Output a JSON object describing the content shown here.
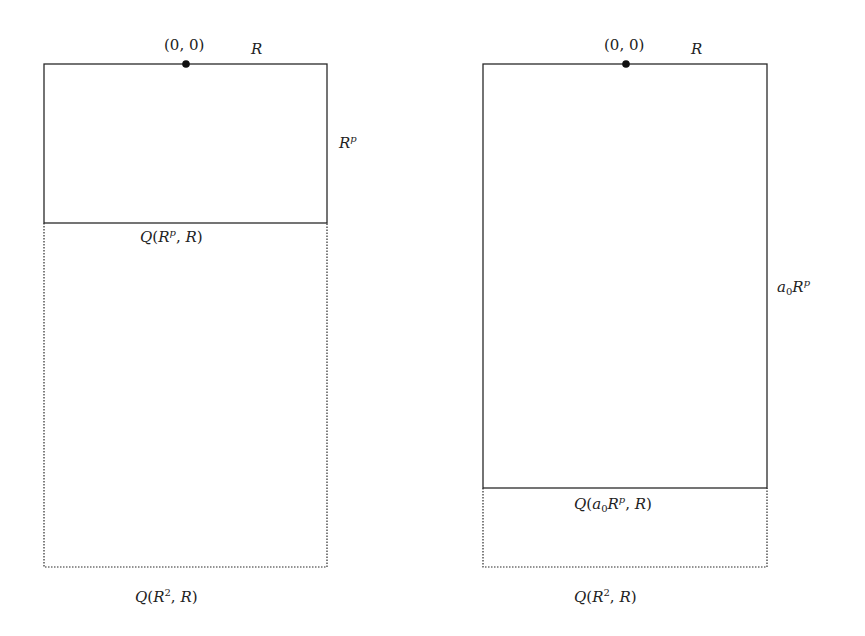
{
  "panels": [
    {
      "id": "left",
      "origin_label": "(0, 0)",
      "top_label": "R",
      "side_label": {
        "base": "R",
        "sup": "p"
      },
      "inner_label": {
        "prefix": "Q(",
        "coef": "",
        "base": "R",
        "sup": "p",
        "suffix": ", R)"
      },
      "outer_label": {
        "prefix": "Q(",
        "base": "R",
        "sup": "2",
        "suffix": ", R)"
      },
      "geometry": {
        "x0": 44,
        "x1": 327,
        "top": 64,
        "divider": 223,
        "bottom": 567,
        "dot_x": 186
      }
    },
    {
      "id": "right",
      "origin_label": "(0, 0)",
      "top_label": "R",
      "side_label": {
        "coef": "a",
        "coef_sub": "0",
        "base": "R",
        "sup": "p"
      },
      "inner_label": {
        "prefix": "Q(",
        "coef": "a",
        "coef_sub": "0",
        "base": "R",
        "sup": "p",
        "suffix": ", R)"
      },
      "outer_label": {
        "prefix": "Q(",
        "base": "R",
        "sup": "2",
        "suffix": ", R)"
      },
      "geometry": {
        "x0": 483,
        "x1": 767,
        "top": 64,
        "divider": 488,
        "bottom": 567,
        "dot_x": 626
      }
    }
  ],
  "colors": {
    "line": "#2a2a2a",
    "dot": "#111111"
  }
}
